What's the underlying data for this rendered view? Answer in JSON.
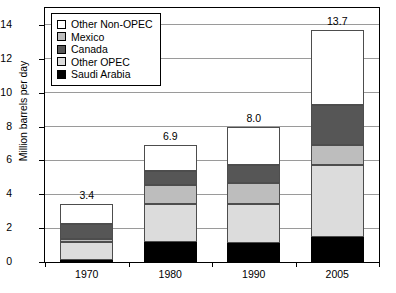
{
  "chart_data": {
    "type": "bar",
    "subtype": "stacked-bar",
    "title": "",
    "xlabel": "",
    "ylabel": "Million barrels per day",
    "categories": [
      "1970",
      "1980",
      "1990",
      "2005"
    ],
    "ylim": [
      0,
      15
    ],
    "yticks": [
      0,
      2,
      4,
      6,
      8,
      10,
      12,
      14
    ],
    "ytick_labels": [
      "0",
      "2",
      "4",
      "6",
      "8",
      "10",
      "12",
      "14"
    ],
    "grid": true,
    "grid_axis": "y",
    "legend_position": "upper-left-inside",
    "series": [
      {
        "name": "Saudi Arabia",
        "color": "#000000",
        "values": [
          0.1,
          1.2,
          1.15,
          1.45
        ]
      },
      {
        "name": "Other OPEC",
        "color": "#dcdcdc",
        "values": [
          1.1,
          2.25,
          2.3,
          4.25
        ]
      },
      {
        "name": "Canada",
        "color": "#565656",
        "values": [
          0.9,
          0.8,
          1.1,
          2.35
        ]
      },
      {
        "name": "Mexico",
        "color": "#bdbdbd",
        "values": [
          0.15,
          1.1,
          1.2,
          1.2
        ]
      },
      {
        "name": "Other Non-OPEC",
        "color": "#ffffff",
        "values": [
          1.15,
          1.55,
          2.25,
          4.45
        ]
      }
    ],
    "stack_order_bottom_to_top": [
      "Saudi Arabia",
      "Other OPEC",
      "Mexico",
      "Canada",
      "Other Non-OPEC"
    ],
    "totals": [
      3.4,
      6.9,
      8.0,
      13.7
    ],
    "total_labels": [
      "3.4",
      "6.9",
      "8.0",
      "13.7"
    ]
  },
  "legend": {
    "items": [
      {
        "label": "Other Non-OPEC",
        "swatch": "legend-swatch-other-non-opec"
      },
      {
        "label": "Mexico",
        "swatch": "legend-swatch-mexico"
      },
      {
        "label": "Canada",
        "swatch": "legend-swatch-canada"
      },
      {
        "label": "Other OPEC",
        "swatch": "legend-swatch-other-opec"
      },
      {
        "label": "Saudi Arabia",
        "swatch": "legend-swatch-saudi-arabia"
      }
    ]
  }
}
